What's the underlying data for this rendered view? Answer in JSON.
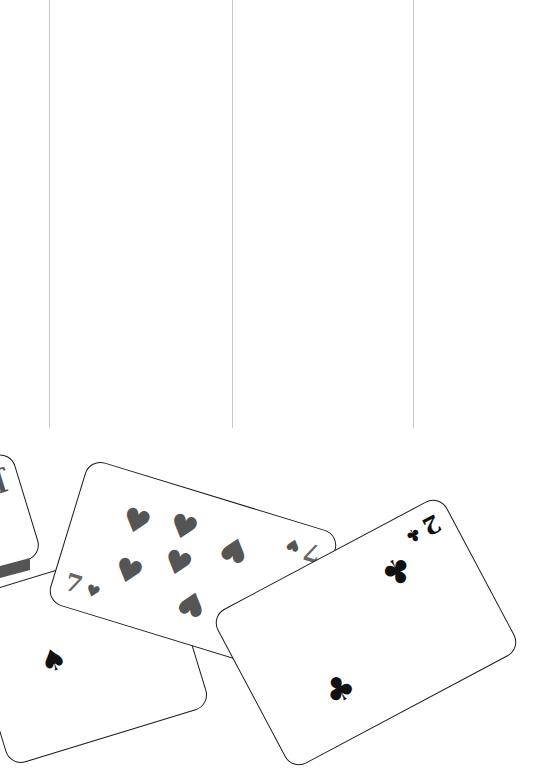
{
  "game": {
    "type": "solitaire",
    "columns": 3,
    "column_line_x": [
      49,
      232,
      413
    ],
    "column_line_color": "#c8c8c8"
  },
  "cards": [
    {
      "id": "jack-card",
      "rank": "J",
      "suit": "spades",
      "suit_glyph": "♠",
      "rank_color": "#555555",
      "partially_hidden": true
    },
    {
      "id": "seven-spades-card",
      "rank": "7",
      "suit": "spades",
      "suit_glyph": "♠",
      "color": "#111111"
    },
    {
      "id": "seven-hearts-card",
      "rank": "7",
      "suit": "hearts",
      "suit_glyph": "♥",
      "color": "#555555",
      "grayscale": true
    },
    {
      "id": "two-clubs-card",
      "rank": "2",
      "suit": "clubs",
      "suit_glyph": "♣",
      "color": "#111111"
    }
  ]
}
